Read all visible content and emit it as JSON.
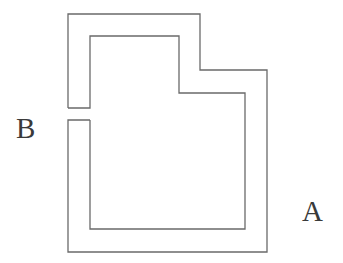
{
  "diagram": {
    "stroke_color": "#666666",
    "background": "#ffffff",
    "labels": {
      "a": "A",
      "b": "B"
    },
    "outer_path": "M 68 108 L 68 14 L 200 14 L 200 70 L 267 70 L 267 252 L 68 252 L 68 120 L 90 120",
    "inner_path": "M 68 108 L 90 108 L 90 36 L 179 36 L 179 93 L 245 93 L 245 229 L 90 229 L 90 120"
  }
}
